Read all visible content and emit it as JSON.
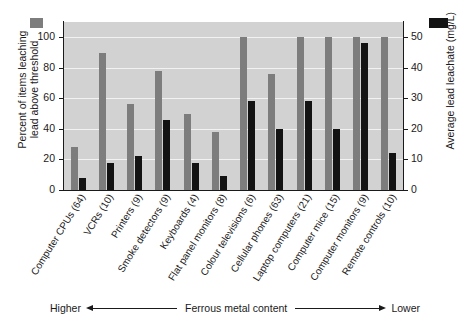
{
  "chart_data": {
    "type": "bar",
    "title": "",
    "subtitle": "",
    "grid": true,
    "legend_position": "top-left and top-right (axis swatches)",
    "categories": [
      "Computer CPUs (64)",
      "VCRs (10)",
      "Printers (9)",
      "Smoke detectors (9)",
      "Keyboards (4)",
      "Flat panel monitors (8)",
      "Colour televisions (6)",
      "Cellular phones (63)",
      "Laptop computers (21)",
      "Computer mice (15)",
      "Computer monitors (9)",
      "Remote controls (10)"
    ],
    "series": [
      {
        "name": "Percent of items leaching lead above threshold",
        "axis": "left",
        "color": "#7d7d7d",
        "unit": "%",
        "values": [
          28,
          90,
          56,
          78,
          50,
          38,
          100,
          76,
          100,
          100,
          100,
          100
        ]
      },
      {
        "name": "Average lead leachate (mg/L)",
        "axis": "right",
        "color": "#131313",
        "unit": "mg/L",
        "values": [
          4,
          9,
          11,
          23,
          9,
          4.5,
          29,
          20,
          29,
          20,
          48,
          12
        ]
      }
    ],
    "xlabel": "Ferrous metal content",
    "ylabel_left": "Percent of items leaching\nlead above threshold",
    "ylabel_right": "Average lead leachate (mg/L)",
    "ylim_left": [
      0,
      110
    ],
    "ylim_right": [
      0,
      55
    ],
    "yticks_left": [
      0,
      20,
      40,
      60,
      80,
      100
    ],
    "yticks_right": [
      0,
      10,
      20,
      30,
      40,
      50
    ],
    "annotation_left": "Higher",
    "annotation_right": "Lower"
  },
  "axes": {
    "left": {
      "title": "Percent of items leaching\nlead above threshold",
      "ticks": [
        "0",
        "20",
        "40",
        "60",
        "80",
        "100"
      ]
    },
    "right": {
      "title": "Average lead leachate (mg/L)",
      "ticks": [
        "0",
        "10",
        "20",
        "30",
        "40",
        "50"
      ]
    }
  },
  "legend": {
    "grey_label": "Percent of items leaching lead above threshold",
    "black_label": "Average lead leachate (mg/L)",
    "grey_color": "#7d7d7d",
    "black_color": "#131313"
  },
  "footer": {
    "higher": "Higher",
    "label": "Ferrous metal content",
    "lower": "Lower"
  },
  "colors": {
    "plot_background": "#d2d2d2",
    "gridline": "#f2f2f2",
    "axis": "#1a1a1a",
    "page_background": "#ffffff"
  }
}
